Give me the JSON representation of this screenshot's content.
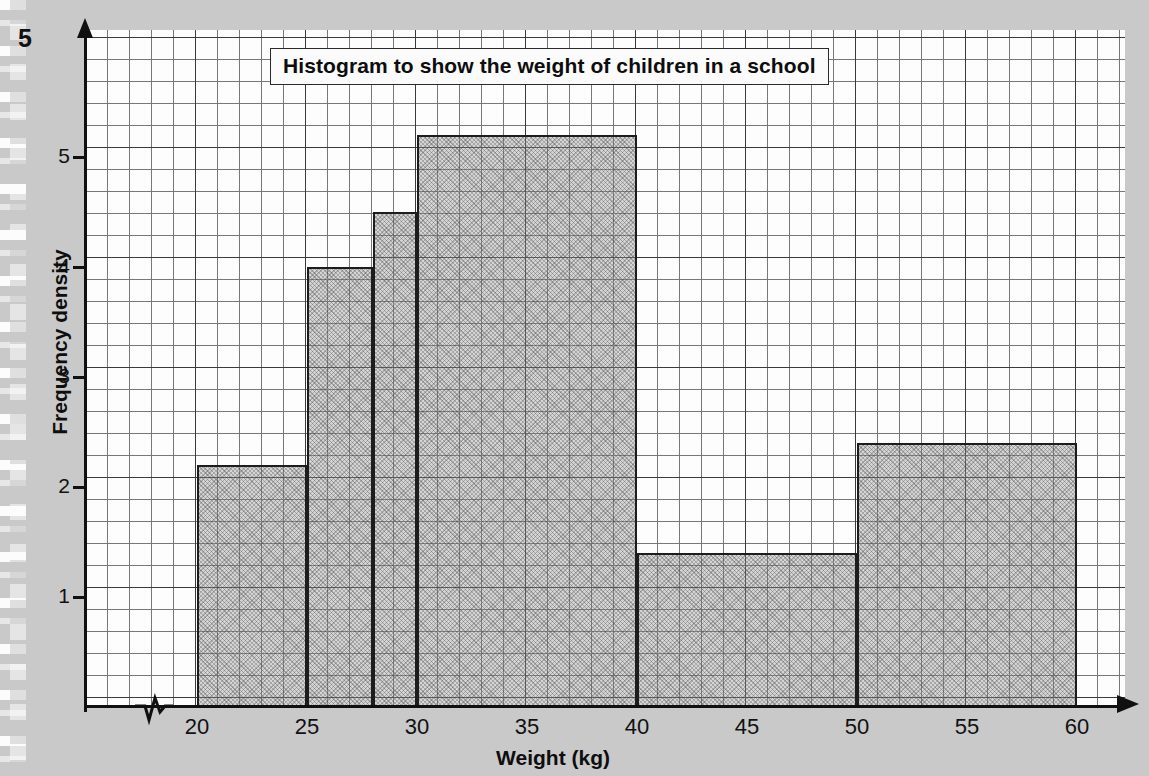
{
  "page": {
    "question_number": "5",
    "background_color": "#c9c9c9"
  },
  "chart_data": {
    "type": "bar",
    "title": "Histogram to show the weight of children in a school",
    "xlabel": "Weight (kg)",
    "ylabel": "Frequency density",
    "grid": true,
    "legend": "none",
    "xlim": [
      20,
      60
    ],
    "ylim": [
      0,
      5.6
    ],
    "x_ticks": [
      "20",
      "25",
      "30",
      "35",
      "40",
      "45",
      "50",
      "55",
      "60"
    ],
    "x_tick_values": [
      20,
      25,
      30,
      35,
      40,
      45,
      50,
      55,
      60
    ],
    "y_ticks": [
      "1",
      "2",
      "3",
      "4",
      "5"
    ],
    "y_tick_values": [
      1,
      2,
      3,
      4,
      5
    ],
    "axis_break": "zigzag-on-x-axis-before-20",
    "bar_fill_color": "#969696",
    "bar_edge_color": "#1d1d1d",
    "bins": [
      {
        "label": "20-25",
        "x_start": 20,
        "x_end": 25,
        "frequency_density": 2.2
      },
      {
        "label": "25-28",
        "x_start": 25,
        "x_end": 28,
        "frequency_density": 4.0
      },
      {
        "label": "28-30",
        "x_start": 28,
        "x_end": 30,
        "frequency_density": 4.5
      },
      {
        "label": "30-40",
        "x_start": 30,
        "x_end": 40,
        "frequency_density": 5.2
      },
      {
        "label": "40-50",
        "x_start": 40,
        "x_end": 50,
        "frequency_density": 1.4
      },
      {
        "label": "50-60",
        "x_start": 50,
        "x_end": 60,
        "frequency_density": 2.4
      }
    ],
    "categories": [
      "20-25",
      "25-28",
      "28-30",
      "30-40",
      "40-50",
      "50-60"
    ],
    "values": [
      2.2,
      4.0,
      4.5,
      5.2,
      1.4,
      2.4
    ]
  }
}
